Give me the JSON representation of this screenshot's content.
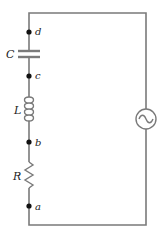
{
  "diagram": {
    "type": "series RLC circuit with AC source",
    "components": {
      "capacitor": {
        "label": "C"
      },
      "inductor": {
        "label": "L"
      },
      "resistor": {
        "label": "R"
      },
      "source": {
        "icon": "ac-source-icon"
      }
    },
    "nodes": [
      {
        "label": "d"
      },
      {
        "label": "c"
      },
      {
        "label": "b"
      },
      {
        "label": "a"
      }
    ],
    "colors": {
      "wire": "#7a7a7a",
      "node": "#111111",
      "text": "#222222"
    }
  }
}
